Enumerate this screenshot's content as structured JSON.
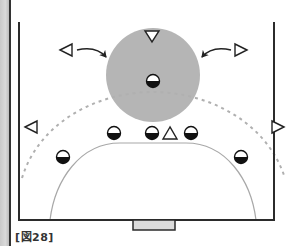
{
  "figure": {
    "label": "[図28]",
    "colors": {
      "court_line": "#2b2b2b",
      "zone_fill": "#b5b5b5",
      "dashed_line": "#b0b0b0",
      "goal_area_line": "#a8a8a8",
      "goal_fill": "#dcdcdc"
    }
  },
  "court": {
    "left_x": 19,
    "right_x": 274,
    "top_y": 22,
    "bottom_y": 220
  },
  "zone_circle": {
    "cx": 153,
    "cy": 75,
    "r": 47
  },
  "goal": {
    "x": 133,
    "y": 220,
    "width": 42,
    "height": 10
  },
  "players_defense": [
    {
      "id": "center-defender",
      "x": 153,
      "y": 81
    },
    {
      "id": "left-wing-defender",
      "x": 63,
      "y": 157
    },
    {
      "id": "left-back-defender",
      "x": 114,
      "y": 133
    },
    {
      "id": "center-line-defender",
      "x": 152,
      "y": 133
    },
    {
      "id": "right-back-defender",
      "x": 191,
      "y": 133
    },
    {
      "id": "right-wing-defender",
      "x": 241,
      "y": 157
    }
  ],
  "players_offense": [
    {
      "id": "center-attacker",
      "dir": "down",
      "x": 152,
      "y": 36
    },
    {
      "id": "left-back-attacker",
      "dir": "left",
      "x": 67,
      "y": 50
    },
    {
      "id": "right-back-attacker",
      "dir": "right",
      "x": 240,
      "y": 50
    },
    {
      "id": "left-wing-attacker",
      "dir": "left",
      "x": 31,
      "y": 127
    },
    {
      "id": "right-wing-attacker",
      "dir": "right",
      "x": 278,
      "y": 127
    },
    {
      "id": "pivot-attacker",
      "dir": "up",
      "x": 170,
      "y": 133
    }
  ],
  "arrows": [
    {
      "id": "arrow-left-to-zone",
      "from": [
        77,
        50
      ],
      "to": [
        107,
        58
      ]
    },
    {
      "id": "arrow-right-to-zone",
      "from": [
        231,
        50
      ],
      "to": [
        202,
        58
      ]
    }
  ]
}
